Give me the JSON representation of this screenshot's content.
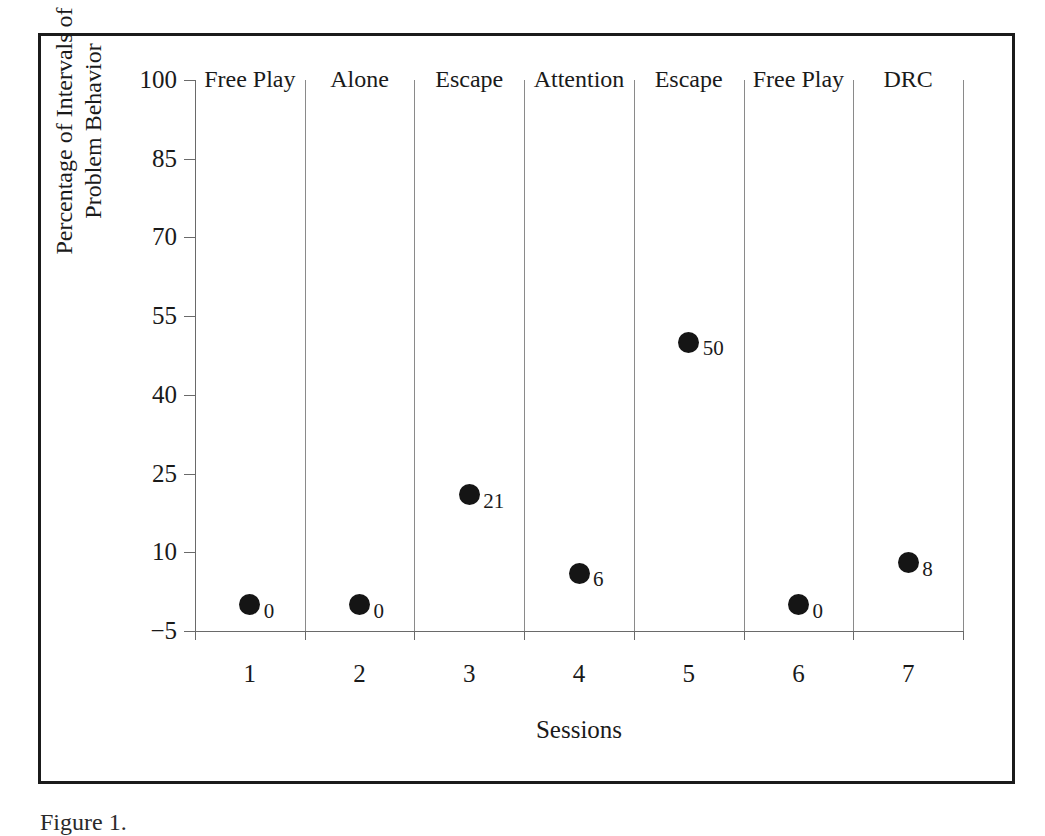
{
  "figure": {
    "caption": "Figure 1.",
    "border_color": "#1b1b1b",
    "marker_color": "#151515",
    "axis_color": "#6a6a6a"
  },
  "chart_data": {
    "type": "scatter",
    "title": "",
    "xlabel": "Sessions",
    "ylabel": "Percentage of Intervals of Problem Behavior",
    "ylabel_line1": "Percentage of Intervals of",
    "ylabel_line2": "Problem Behavior",
    "x": [
      1,
      2,
      3,
      4,
      5,
      6,
      7
    ],
    "categories": [
      "1",
      "2",
      "3",
      "4",
      "5",
      "6",
      "7"
    ],
    "values": [
      0,
      0,
      21,
      6,
      50,
      0,
      8
    ],
    "point_labels": [
      "0",
      "0",
      "21",
      "6",
      "50",
      "0",
      "8"
    ],
    "yticks": [
      100,
      85,
      70,
      55,
      40,
      25,
      10,
      -5
    ],
    "ytick_labels": [
      "100",
      "85",
      "70",
      "55",
      "40",
      "25",
      "10",
      "−5"
    ],
    "ylim": [
      -5,
      100
    ],
    "xlim": [
      0.5,
      7.5
    ],
    "grid": false,
    "legend": null,
    "phases": [
      {
        "label": "Free Play",
        "sessions": [
          1
        ]
      },
      {
        "label": "Alone",
        "sessions": [
          2
        ]
      },
      {
        "label": "Escape",
        "sessions": [
          3
        ]
      },
      {
        "label": "Attention",
        "sessions": [
          4
        ]
      },
      {
        "label": "Escape",
        "sessions": [
          5
        ]
      },
      {
        "label": "Free Play",
        "sessions": [
          6
        ]
      },
      {
        "label": "DRC",
        "sessions": [
          7
        ]
      }
    ]
  }
}
